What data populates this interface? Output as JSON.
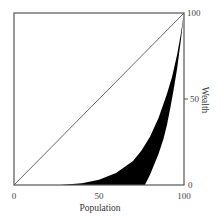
{
  "chart_data": {
    "type": "area",
    "title": "",
    "xlabel": "Population",
    "ylabel": "Wealth",
    "xlim": [
      0,
      100
    ],
    "ylim": [
      0,
      100
    ],
    "x_ticks": [
      "0",
      "50",
      "100"
    ],
    "y_ticks": [
      "0",
      "50",
      "100"
    ],
    "y_axis_position": "right",
    "grid": false,
    "legend": null,
    "series": [
      {
        "name": "Line of equality",
        "style": "line",
        "points": [
          [
            0,
            0
          ],
          [
            100,
            100
          ]
        ]
      },
      {
        "name": "Lorenz curve (upper bound)",
        "style": "boundary",
        "points": [
          [
            0,
            0
          ],
          [
            27,
            0
          ],
          [
            40,
            1
          ],
          [
            50,
            3
          ],
          [
            60,
            7
          ],
          [
            70,
            14
          ],
          [
            75,
            20
          ],
          [
            80,
            28
          ],
          [
            85,
            39
          ],
          [
            90,
            53
          ],
          [
            93,
            63
          ],
          [
            96,
            76
          ],
          [
            98,
            87
          ],
          [
            100,
            100
          ]
        ]
      },
      {
        "name": "Lorenz curve (lower bound)",
        "style": "boundary",
        "points": [
          [
            0,
            0
          ],
          [
            77,
            0
          ],
          [
            80,
            6
          ],
          [
            85,
            18
          ],
          [
            88,
            27
          ],
          [
            90,
            35
          ],
          [
            92,
            45
          ],
          [
            94,
            56
          ],
          [
            96,
            68
          ],
          [
            98,
            83
          ],
          [
            100,
            100
          ]
        ]
      }
    ],
    "shaded_region": "area between upper and lower Lorenz curves, filled black"
  },
  "axes": {
    "x_label": "Population",
    "y_label": "Wealth",
    "x_tick_0": "0",
    "x_tick_50": "50",
    "x_tick_100": "100",
    "y_tick_0": "0",
    "y_tick_50": "50",
    "y_tick_100": "100"
  },
  "colors": {
    "fill": "#000000",
    "frame": "#555555",
    "diagonal": "#666666"
  }
}
